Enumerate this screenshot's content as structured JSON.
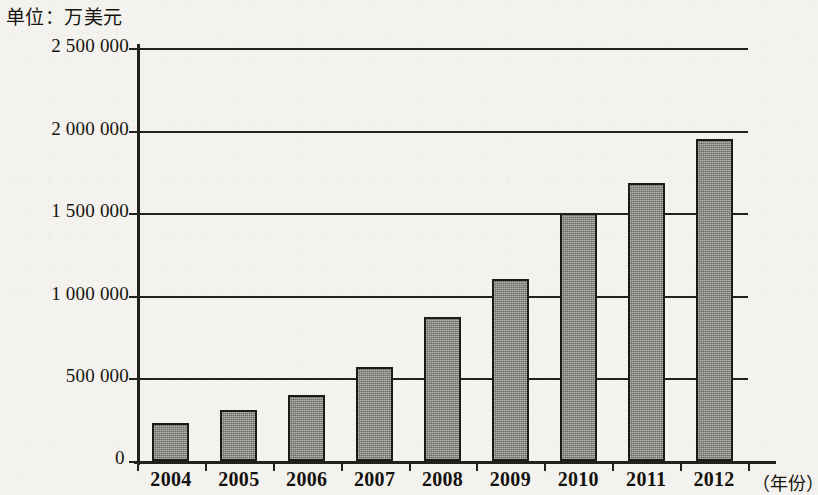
{
  "caption": {
    "unit_text": "单位：万美元"
  },
  "chart_data": {
    "type": "bar",
    "title": "",
    "subtitle": "",
    "unit_note": "单位：万美元",
    "xlabel": "（年份）",
    "ylabel": "",
    "categories": [
      "2004",
      "2005",
      "2006",
      "2007",
      "2008",
      "2009",
      "2010",
      "2011",
      "2012"
    ],
    "values": [
      230000,
      310000,
      400000,
      570000,
      870000,
      1100000,
      1500000,
      1680000,
      1950000
    ],
    "ylim": [
      0,
      2500000
    ],
    "y_ticks": [
      0,
      500000,
      1000000,
      1500000,
      2000000,
      2500000
    ],
    "y_tick_labels": [
      "0",
      "500 000",
      "1 000 000",
      "1 500 000",
      "2 000 000",
      "2 500 000"
    ],
    "grid": true,
    "grid_axis": "y",
    "legend": null,
    "legend_position": "none",
    "series": [
      {
        "name": "金额",
        "values": [
          230000,
          310000,
          400000,
          570000,
          870000,
          1100000,
          1500000,
          1680000,
          1950000
        ]
      }
    ],
    "colors": {
      "bar_fill": "#8b8b84",
      "bar_border": "#1d1b16",
      "axis": "#23211b",
      "background": "#f4f2ee",
      "text": "#17150f"
    }
  }
}
